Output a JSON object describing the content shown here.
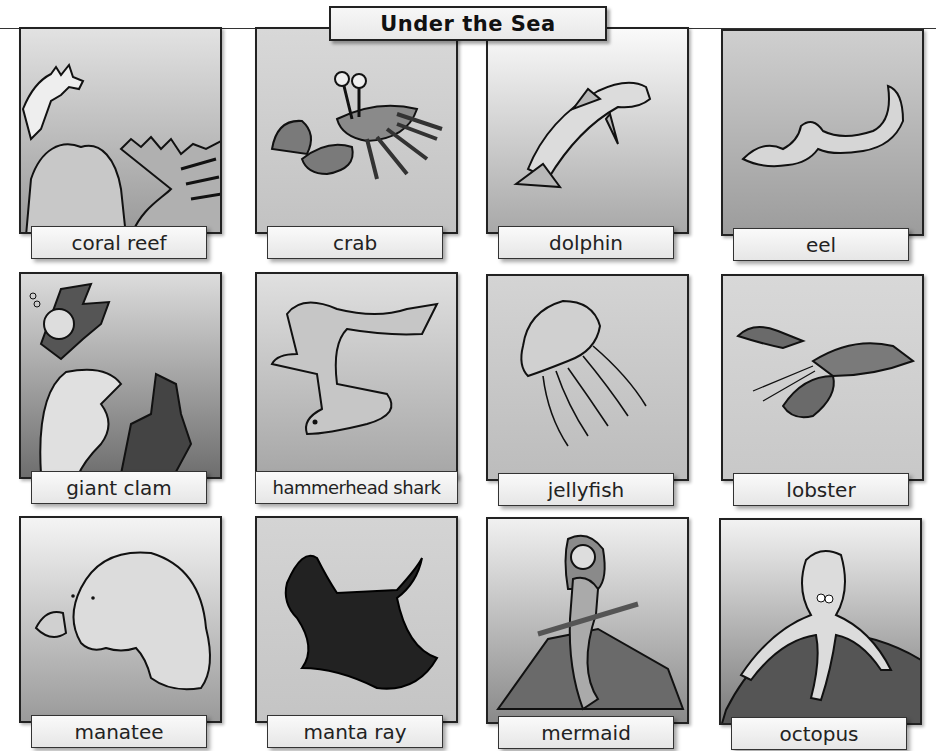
{
  "title": "Under the Sea",
  "cards": [
    {
      "label": "coral reef",
      "icon": "coral-reef-illustration"
    },
    {
      "label": "crab",
      "icon": "crab-illustration"
    },
    {
      "label": "dolphin",
      "icon": "dolphin-illustration"
    },
    {
      "label": "eel",
      "icon": "eel-illustration"
    },
    {
      "label": "giant clam",
      "icon": "giant-clam-illustration"
    },
    {
      "label": "hammerhead shark",
      "icon": "hammerhead-shark-illustration"
    },
    {
      "label": "jellyfish",
      "icon": "jellyfish-illustration"
    },
    {
      "label": "lobster",
      "icon": "lobster-illustration"
    },
    {
      "label": "manatee",
      "icon": "manatee-illustration"
    },
    {
      "label": "manta ray",
      "icon": "manta-ray-illustration"
    },
    {
      "label": "mermaid",
      "icon": "mermaid-illustration"
    },
    {
      "label": "octopus",
      "icon": "octopus-illustration"
    }
  ],
  "colors": {
    "panel_light": "#e8e8e8",
    "panel_dark": "#8a8a8a",
    "outline": "#222222",
    "label_bg": "#f2f2f2"
  }
}
